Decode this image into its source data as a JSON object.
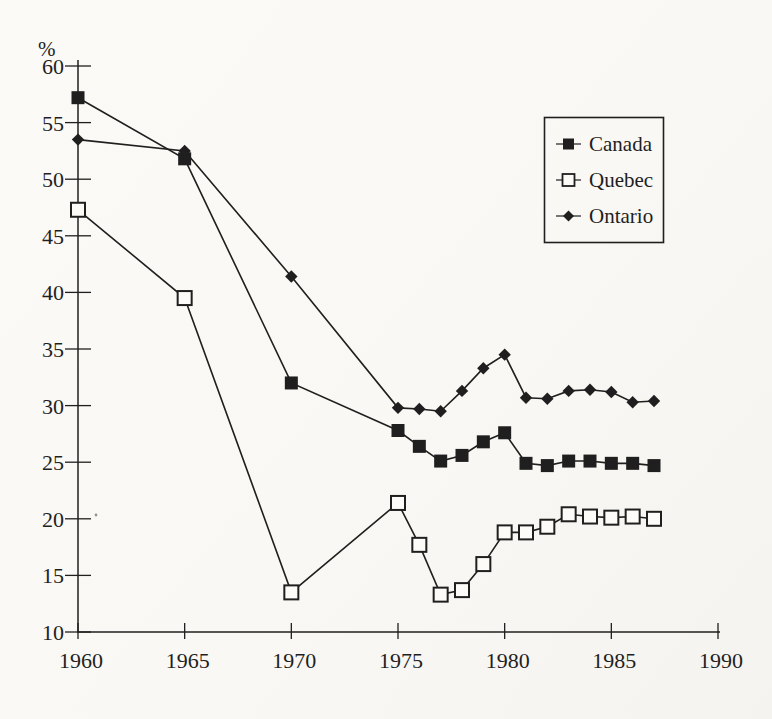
{
  "figure": {
    "kind": "scanned-book-line-chart",
    "paper_color": "#fbfaf7",
    "ink_color": "#1f1f1f",
    "open_marker_fill": "#fcfbf8"
  },
  "chart_data": {
    "type": "line",
    "title": "",
    "xlabel": "",
    "ylabel": "%",
    "xlim": [
      1960,
      1990
    ],
    "ylim": [
      10,
      60
    ],
    "grid": false,
    "legend_position": "upper-right",
    "x_ticks": [
      1960,
      1965,
      1970,
      1975,
      1980,
      1985,
      1990
    ],
    "y_ticks": [
      10,
      15,
      20,
      25,
      30,
      35,
      40,
      45,
      50,
      55,
      60
    ],
    "x": [
      1960,
      1965,
      1970,
      1975,
      1976,
      1977,
      1978,
      1979,
      1980,
      1981,
      1982,
      1983,
      1984,
      1985,
      1986,
      1987
    ],
    "series": [
      {
        "name": "Canada",
        "marker": "filled-square",
        "values": [
          57.2,
          51.8,
          32.0,
          27.8,
          26.4,
          25.1,
          25.6,
          26.8,
          27.6,
          24.9,
          24.7,
          25.1,
          25.1,
          24.9,
          24.9,
          24.7
        ]
      },
      {
        "name": "Quebec",
        "marker": "open-square",
        "values": [
          47.3,
          39.5,
          13.5,
          21.4,
          17.7,
          13.3,
          13.7,
          16.0,
          18.8,
          18.8,
          19.3,
          20.4,
          20.2,
          20.1,
          20.2,
          20.0
        ]
      },
      {
        "name": "Ontario",
        "marker": "filled-diamond",
        "values": [
          53.5,
          52.5,
          41.4,
          29.8,
          29.7,
          29.5,
          31.3,
          33.3,
          34.5,
          30.7,
          30.6,
          31.3,
          31.4,
          31.2,
          30.3,
          30.4
        ]
      }
    ]
  }
}
